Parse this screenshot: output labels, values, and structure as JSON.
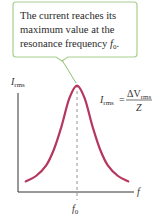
{
  "callout": {
    "lines": [
      "The current reaches its",
      "maximum value at the",
      "resonance frequency "
    ],
    "inline_symbol": "f",
    "inline_subscript": "0",
    "trailing": ".",
    "border_color": "#a8cf8e"
  },
  "axes": {
    "y_label": "I",
    "y_label_sub": "rms",
    "x_label": "f",
    "x_tick_label": "f",
    "x_tick_label_sub": "0"
  },
  "formula": {
    "lhs": "I",
    "lhs_sub": "rms",
    "equals": "=",
    "numerator": "ΔV",
    "numerator_sub": "rms",
    "denominator": "Z"
  },
  "colors": {
    "curve": "#b5375e",
    "axis": "#333333",
    "dashed": "#888888",
    "pointer": "#8fbf73"
  },
  "chart_data": {
    "type": "line",
    "title": "",
    "xlabel": "f",
    "ylabel": "I_rms",
    "peak_at": "f0",
    "x_ticks": [
      "f0"
    ],
    "series": [
      {
        "name": "I_rms",
        "x": [
          -1.0,
          -0.8,
          -0.6,
          -0.45,
          -0.3,
          -0.15,
          0,
          0.15,
          0.3,
          0.45,
          0.6,
          0.8,
          1.0
        ],
        "y": [
          0.1,
          0.15,
          0.25,
          0.4,
          0.62,
          0.88,
          1.0,
          0.88,
          0.62,
          0.4,
          0.25,
          0.15,
          0.1
        ]
      }
    ],
    "xlim": [
      -1.15,
      1.15
    ],
    "ylim": [
      0,
      1.1
    ],
    "grid": false
  }
}
